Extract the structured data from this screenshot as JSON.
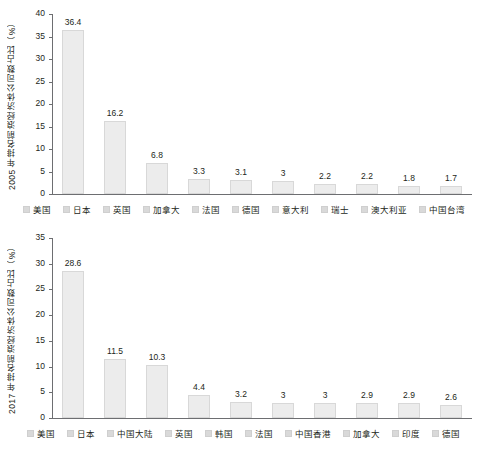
{
  "chart_data": [
    {
      "type": "bar",
      "title": "",
      "ylabel": "2005 年排名前浪经济体公司数占比（%）",
      "xlabel": "",
      "categories": [
        "美国",
        "日本",
        "英国",
        "加拿大",
        "法国",
        "德国",
        "意大利",
        "瑞士",
        "澳大利亚",
        "中国台湾"
      ],
      "values": [
        36.4,
        16.2,
        6.8,
        3.3,
        3.1,
        3,
        2.2,
        2.2,
        1.8,
        1.7
      ],
      "value_labels": [
        "36.4",
        "16.2",
        "6.8",
        "3.3",
        "3.1",
        "3",
        "2.2",
        "2.2",
        "1.8",
        "1.7"
      ],
      "yticks": [
        0,
        5,
        10,
        15,
        20,
        25,
        30,
        35,
        40
      ],
      "ytick_labels": [
        "0",
        "5",
        "10",
        "15",
        "20",
        "25",
        "30",
        "35",
        "40"
      ],
      "ylim": [
        0,
        40
      ],
      "grid": false,
      "legend_position": "bottom",
      "bar_color": "#ececec"
    },
    {
      "type": "bar",
      "title": "",
      "ylabel": "2017 年排名前浪经济体公司数占比（%）",
      "xlabel": "",
      "categories": [
        "美国",
        "日本",
        "中国大陆",
        "英国",
        "韩国",
        "法国",
        "中国香港",
        "加拿大",
        "印度",
        "德国"
      ],
      "values": [
        28.6,
        11.5,
        10.3,
        4.4,
        3.2,
        3,
        3,
        2.9,
        2.9,
        2.6
      ],
      "value_labels": [
        "28.6",
        "11.5",
        "10.3",
        "4.4",
        "3.2",
        "3",
        "3",
        "2.9",
        "2.9",
        "2.6"
      ],
      "yticks": [
        0,
        5,
        10,
        15,
        20,
        25,
        30,
        35
      ],
      "ytick_labels": [
        "0",
        "5",
        "10",
        "15",
        "20",
        "25",
        "30",
        "35"
      ],
      "ylim": [
        0,
        35
      ],
      "grid": false,
      "legend_position": "bottom",
      "bar_color": "#ececec"
    }
  ]
}
